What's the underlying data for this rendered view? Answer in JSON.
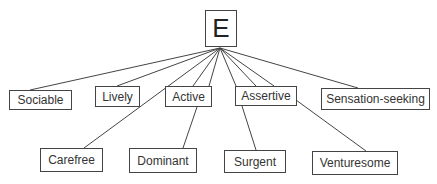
{
  "diagram": {
    "root": {
      "id": "E",
      "label": "E",
      "x": 205,
      "y": 10,
      "w": 32,
      "h": 37
    },
    "hub": {
      "x": 220,
      "y": 48
    },
    "nodes": [
      {
        "id": "sociable",
        "label": "Sociable",
        "x": 9,
        "y": 90,
        "w": 63,
        "h": 20
      },
      {
        "id": "lively",
        "label": "Lively",
        "x": 95,
        "y": 86,
        "w": 45,
        "h": 21
      },
      {
        "id": "active",
        "label": "Active",
        "x": 165,
        "y": 86,
        "w": 47,
        "h": 21
      },
      {
        "id": "assertive",
        "label": "Assertive",
        "x": 235,
        "y": 86,
        "w": 62,
        "h": 20
      },
      {
        "id": "sensation-seeking",
        "label": "Sensation-seeking",
        "x": 321,
        "y": 88,
        "w": 109,
        "h": 22
      },
      {
        "id": "carefree",
        "label": "Carefree",
        "x": 40,
        "y": 148,
        "w": 63,
        "h": 24
      },
      {
        "id": "dominant",
        "label": "Dominant",
        "x": 129,
        "y": 148,
        "w": 68,
        "h": 25
      },
      {
        "id": "surgent",
        "label": "Surgent",
        "x": 224,
        "y": 150,
        "w": 62,
        "h": 23
      },
      {
        "id": "venturesome",
        "label": "Venturesome",
        "x": 312,
        "y": 151,
        "w": 86,
        "h": 24
      }
    ],
    "edges": [
      {
        "from": "E",
        "to": "sociable",
        "x1": 220,
        "y1": 48,
        "x2": 30,
        "y2": 90
      },
      {
        "from": "E",
        "to": "lively",
        "x1": 220,
        "y1": 48,
        "x2": 117,
        "y2": 86
      },
      {
        "from": "E",
        "to": "carefree",
        "x1": 220,
        "y1": 48,
        "x2": 84,
        "y2": 148
      },
      {
        "from": "E",
        "to": "active",
        "x1": 220,
        "y1": 48,
        "x2": 193,
        "y2": 86
      },
      {
        "from": "E",
        "to": "active",
        "x1": 220,
        "y1": 48,
        "x2": 209,
        "y2": 86
      },
      {
        "from": "E",
        "to": "surgent",
        "x1": 220,
        "y1": 48,
        "x2": 236,
        "y2": 86
      },
      {
        "from": "E",
        "to": "assertive",
        "x1": 220,
        "y1": 48,
        "x2": 256,
        "y2": 86
      },
      {
        "from": "E",
        "to": "assertive",
        "x1": 220,
        "y1": 48,
        "x2": 274,
        "y2": 86
      },
      {
        "from": "E",
        "to": "sensation-seeking",
        "x1": 220,
        "y1": 48,
        "x2": 358,
        "y2": 88
      },
      {
        "from": "active",
        "to": "dominant",
        "x1": 197,
        "y1": 107,
        "x2": 183,
        "y2": 148
      },
      {
        "from": "assertive",
        "to": "surgent",
        "x1": 242,
        "y1": 106,
        "x2": 256,
        "y2": 150
      },
      {
        "from": "assertive",
        "to": "venturesome",
        "x1": 296,
        "y1": 100,
        "x2": 366,
        "y2": 151
      }
    ]
  }
}
